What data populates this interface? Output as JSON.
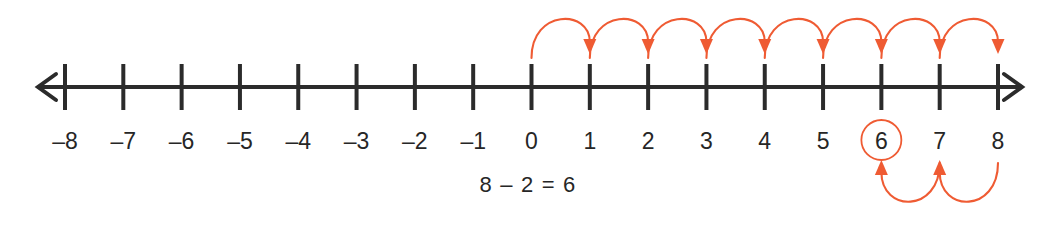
{
  "figure": {
    "background_color": "#ffffff",
    "axis_color": "#2b2b2b",
    "hop_color": "#ef5b33",
    "label_color": "#262626"
  },
  "chart_data": {
    "type": "line",
    "title": "",
    "subtitle": "",
    "xlabel": "",
    "ylabel": "",
    "grid": false,
    "legend_position": "none",
    "axis": {
      "orientation": "horizontal",
      "min": -8,
      "max": 8,
      "step": 1,
      "left_arrow": true,
      "right_arrow": true,
      "pixel_left_tick_x": 65,
      "pixel_right_tick_x": 998,
      "pixel_axis_y": 87,
      "tick_top_y": 64,
      "tick_bottom_y": 110,
      "left_arrow_tip_x": 38,
      "right_arrow_tip_x": 1022
    },
    "categories": [
      "-8",
      "-7",
      "-6",
      "-5",
      "-4",
      "-3",
      "-2",
      "-1",
      "0",
      "1",
      "2",
      "3",
      "4",
      "5",
      "6",
      "7",
      "8"
    ],
    "tick_labels": [
      "–8",
      "–7",
      "–6",
      "–5",
      "–4",
      "–3",
      "–2",
      "–1",
      "0",
      "1",
      "2",
      "3",
      "4",
      "5",
      "6",
      "7",
      "8"
    ],
    "tick_values": [
      -8,
      -7,
      -6,
      -5,
      -4,
      -3,
      -2,
      -1,
      0,
      1,
      2,
      3,
      4,
      5,
      6,
      7,
      8
    ],
    "annotations": {
      "equation": "8 – 2 = 6",
      "equation_x": 528,
      "equation_y": 192,
      "circled_value": 6,
      "circle_radius": 20,
      "circle_center_y": 140
    },
    "series": [
      {
        "name": "forward hops above line",
        "color": "#ef5b33",
        "direction": "right",
        "position": "above",
        "arrow_direction": "down",
        "hops": [
          {
            "from": 0,
            "to": 1
          },
          {
            "from": 1,
            "to": 2
          },
          {
            "from": 2,
            "to": 3
          },
          {
            "from": 3,
            "to": 4
          },
          {
            "from": 4,
            "to": 5
          },
          {
            "from": 5,
            "to": 6
          },
          {
            "from": 6,
            "to": 7
          },
          {
            "from": 7,
            "to": 8
          }
        ]
      },
      {
        "name": "backward hops below labels",
        "color": "#ef5b33",
        "direction": "left",
        "position": "below",
        "arrow_direction": "up",
        "hops": [
          {
            "from": 8,
            "to": 7
          },
          {
            "from": 7,
            "to": 6
          }
        ]
      }
    ]
  }
}
